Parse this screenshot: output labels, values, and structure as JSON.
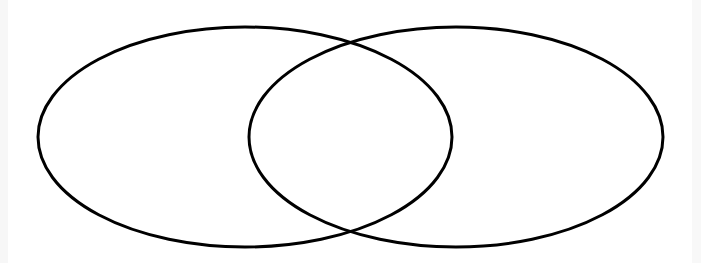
{
  "diagram": {
    "type": "venn",
    "canvas": {
      "width": 701,
      "height": 263,
      "background": "#ffffff"
    },
    "stroke": {
      "color": "#000000",
      "width": 3
    },
    "sets": [
      {
        "id": "left",
        "label": "",
        "cx": 245,
        "cy": 137,
        "rx": 207,
        "ry": 110
      },
      {
        "id": "right",
        "label": "",
        "cx": 456,
        "cy": 137,
        "rx": 207,
        "ry": 110
      }
    ],
    "intersection_label": ""
  }
}
